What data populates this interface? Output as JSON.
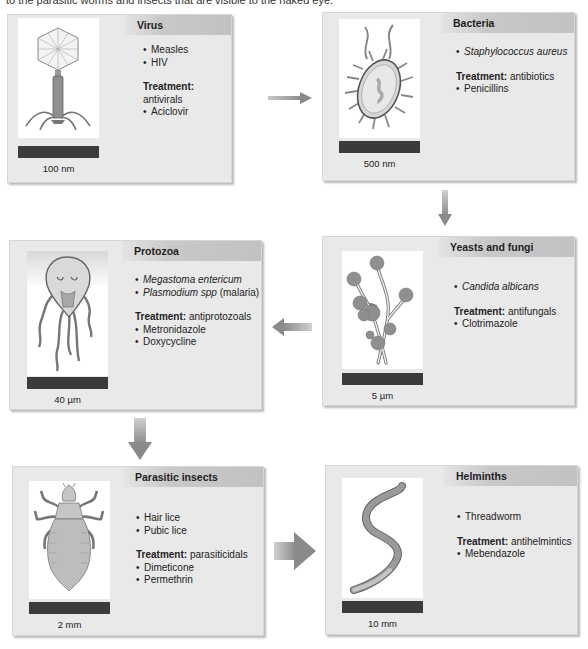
{
  "caption": "to the parasitic worms and insects that are visible to the naked eye.",
  "cards": [
    {
      "id": "virus",
      "title": "Virus",
      "examples": [
        {
          "text": "Measles",
          "italic": false
        },
        {
          "text": "HIV",
          "italic": false
        }
      ],
      "treatment_label": "Treatment:",
      "treatment": "antivirals",
      "drugs": [
        "Aciclovir"
      ],
      "scale": "100 nm",
      "icon": "bacteriophage-virus-icon"
    },
    {
      "id": "bacteria",
      "title": "Bacteria",
      "examples": [
        {
          "text": "Staphylococcus aureus",
          "italic": true
        }
      ],
      "treatment_label": "Treatment:",
      "treatment": "antibiotics",
      "drugs": [
        "Penicillins"
      ],
      "scale": "500 nm",
      "icon": "bacterium-icon"
    },
    {
      "id": "protozoa",
      "title": "Protozoa",
      "examples": [
        {
          "text": "Megastoma entericum",
          "italic": true
        },
        {
          "text": "Plasmodium spp",
          "italic": true,
          "suffix": " (malaria)"
        }
      ],
      "treatment_label": "Treatment:",
      "treatment": "antiprotozoals",
      "drugs": [
        "Metronidazole",
        "Doxycycline"
      ],
      "scale": "40 µm",
      "icon": "giardia-protozoan-icon"
    },
    {
      "id": "yeasts-fungi",
      "title": "Yeasts and fungi",
      "examples": [
        {
          "text": "Candida albicans",
          "italic": true
        }
      ],
      "treatment_label": "Treatment:",
      "treatment": "antifungals",
      "drugs": [
        "Clotrimazole"
      ],
      "scale": "5 µm",
      "icon": "fungal-hyphae-icon"
    },
    {
      "id": "parasitic-insects",
      "title": "Parasitic insects",
      "examples": [
        {
          "text": "Hair lice",
          "italic": false
        },
        {
          "text": "Pubic lice",
          "italic": false
        }
      ],
      "treatment_label": "Treatment:",
      "treatment": "parasiticidals",
      "drugs": [
        "Dimeticone",
        "Permethrin"
      ],
      "scale": "2 mm",
      "icon": "louse-icon"
    },
    {
      "id": "helminths",
      "title": "Helminths",
      "examples": [
        {
          "text": "Threadworm",
          "italic": false
        }
      ],
      "treatment_label": "Treatment:",
      "treatment": "antihelmintics",
      "drugs": [
        "Mebendazole"
      ],
      "scale": "10 mm",
      "icon": "worm-icon"
    }
  ],
  "colors": {
    "card_bg": "#e9e9e9",
    "header_gradient_end": "#c2c2c2",
    "scale_bar": "#3b3b3b",
    "arrow": "#8a8a8a",
    "organism_fill": "#8f8f8f"
  }
}
